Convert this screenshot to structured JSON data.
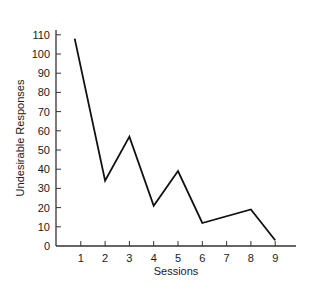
{
  "chart_data": {
    "type": "line",
    "title": "",
    "xlabel": "Sessions",
    "ylabel": "Undesirable Responses",
    "x_ticks": [
      1,
      2,
      3,
      4,
      5,
      6,
      7,
      8,
      9
    ],
    "y_ticks": [
      0,
      10,
      20,
      30,
      40,
      50,
      60,
      70,
      80,
      90,
      100,
      110
    ],
    "xlim": [
      0,
      9.8
    ],
    "ylim": [
      0,
      112
    ],
    "grid": false,
    "legend": null,
    "series": [
      {
        "name": "Undesirable Responses",
        "color": "#111111",
        "points": [
          {
            "x": 0.75,
            "y": 108
          },
          {
            "x": 2,
            "y": 34
          },
          {
            "x": 3,
            "y": 57
          },
          {
            "x": 4,
            "y": 21
          },
          {
            "x": 5,
            "y": 39
          },
          {
            "x": 6,
            "y": 12
          },
          {
            "x": 8,
            "y": 19
          },
          {
            "x": 9,
            "y": 3
          }
        ]
      }
    ]
  },
  "layout": {
    "plot_left": 56,
    "plot_bottom": 246,
    "px_per_x": 24.3,
    "x_origin_px": 56.5,
    "px_per_y": 1.92,
    "axis_top": 30,
    "axis_right": 296
  }
}
